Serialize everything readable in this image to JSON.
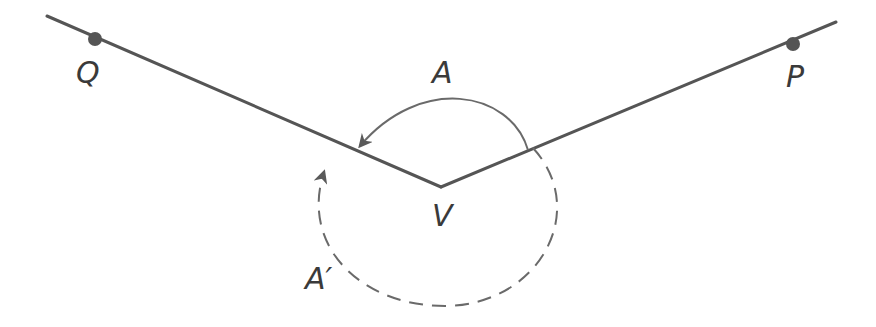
{
  "diagram": {
    "colors": {
      "line": "#555555",
      "point": "#555555",
      "label": "#3a3a3a",
      "background": "#ffffff"
    },
    "points": [
      {
        "id": "Q",
        "label": "Q",
        "x": 95,
        "y": 39
      },
      {
        "id": "P",
        "label": "P",
        "x": 793,
        "y": 44
      },
      {
        "id": "V",
        "label": "V",
        "x": 441,
        "y": 187
      }
    ],
    "rays": [
      {
        "id": "ray-VQ",
        "from": "V",
        "toward": "Q"
      },
      {
        "id": "ray-VP",
        "from": "V",
        "toward": "P"
      }
    ],
    "angles": [
      {
        "id": "A",
        "label": "A",
        "style": "solid",
        "direction": "counterclockwise from VP to VQ"
      },
      {
        "id": "A-prime",
        "label": "A′",
        "style": "dashed",
        "direction": "clockwise from VP to VQ (reflex)"
      }
    ]
  }
}
